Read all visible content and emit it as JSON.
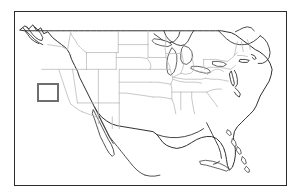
{
  "figure": {
    "kind": "locator-map",
    "canvas": {
      "width": 302,
      "height": 196
    },
    "background_color": "#ffffff"
  },
  "frame": {
    "name": "map-border-frame",
    "x": 14,
    "y": 11,
    "width": 273,
    "height": 175,
    "border_color": "#2b2b2b",
    "border_width": 1.5,
    "fill_color": "#ffffff"
  },
  "map": {
    "region_name": "Contiguous United States",
    "state_border_color": "#b9b9b9",
    "national_outline_color": "#2d2d2d",
    "coastline_color": "#333333",
    "lake_color": "#ffffff",
    "land_fill": "#ffffff",
    "projection_note": "equirectangular-style outline"
  },
  "highlight": {
    "name": "region-highlight-box",
    "shape": "rectangle",
    "label": "",
    "approximate_location": "California-Nevada border",
    "x": 37,
    "y": 83,
    "width": 22,
    "height": 19,
    "border_color": "#6e6e6e",
    "border_width": 2.5,
    "fill": "none"
  }
}
